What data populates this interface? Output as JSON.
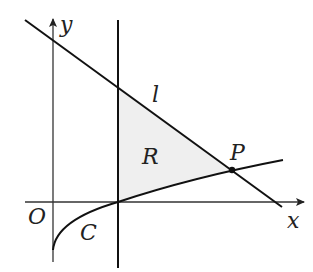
{
  "diagram": {
    "colors": {
      "stroke": "#111111",
      "axis": "#333333",
      "region_fill": "#efefef",
      "background": "#ffffff"
    },
    "labels": {
      "y_axis": "y",
      "x_axis": "x",
      "origin": "O",
      "line": "l",
      "curve": "C",
      "region": "R",
      "point": "P"
    }
  }
}
